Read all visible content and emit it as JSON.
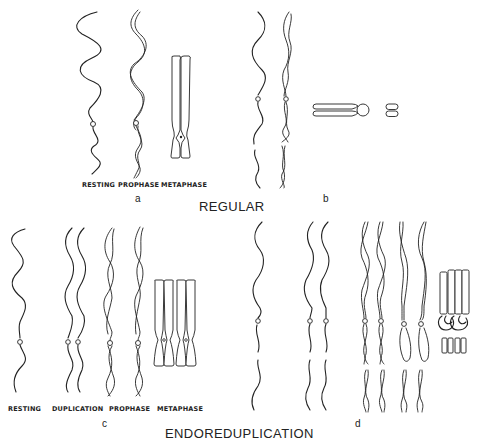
{
  "figure": {
    "panels": {
      "a": {
        "letter": "a",
        "stages": [
          "RESTING",
          "PROPHASE",
          "METAPHASE"
        ]
      },
      "b": {
        "letter": "b"
      },
      "c": {
        "letter": "c",
        "stages": [
          "RESTING",
          "DUPLICATION",
          "PROPHASE",
          "METAPHASE"
        ]
      },
      "d": {
        "letter": "d"
      }
    },
    "headings": {
      "regular": "REGULAR",
      "endoreduplication": "ENDOREDUPLICATION"
    },
    "colors": {
      "ink": "#222222",
      "background": "#ffffff"
    }
  }
}
